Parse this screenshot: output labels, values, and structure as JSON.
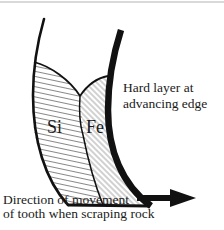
{
  "diagram": {
    "type": "cross-section schematic",
    "regions": [
      {
        "id": "si",
        "label": "Si",
        "fill": "horizontal-hatching"
      },
      {
        "id": "fe",
        "label": "Fe",
        "fill": "diagonal-hatching"
      }
    ],
    "annotations": {
      "hard_layer": {
        "line1": "Hard layer at",
        "line2": "advancing edge"
      },
      "direction": {
        "line1": "Direction of movement",
        "line2": "of tooth when scraping rock"
      }
    },
    "arrow": {
      "direction": "right"
    },
    "colors": {
      "ink": "#111111",
      "hatch": "#6a6a6a",
      "background": "#ffffff"
    }
  }
}
